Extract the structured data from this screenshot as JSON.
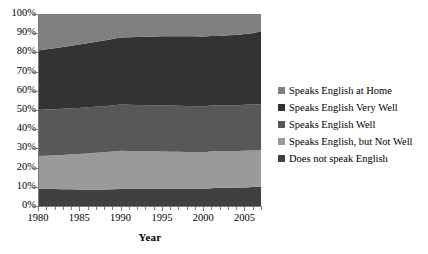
{
  "chart_data": {
    "type": "area",
    "stacked": true,
    "title": "",
    "xlabel": "Year",
    "ylabel": "",
    "xlim": [
      1980,
      2007
    ],
    "ylim": [
      0,
      100
    ],
    "grid": false,
    "legend_position": "right",
    "x": [
      1980,
      1981,
      1982,
      1983,
      1984,
      1985,
      1986,
      1987,
      1988,
      1989,
      1990,
      1991,
      1992,
      1993,
      1994,
      1995,
      1996,
      1997,
      1998,
      1999,
      2000,
      2001,
      2002,
      2003,
      2004,
      2005,
      2006,
      2007
    ],
    "x_tick_labels": [
      "1980",
      "1985",
      "1990",
      "1995",
      "2000",
      "2005"
    ],
    "x_tick_values": [
      1980,
      1985,
      1990,
      1995,
      2000,
      2005
    ],
    "y_tick_labels": [
      "0%",
      "10%",
      "20%",
      "30%",
      "40%",
      "50%",
      "60%",
      "70%",
      "80%",
      "90%",
      "100%"
    ],
    "y_tick_values": [
      0,
      10,
      20,
      30,
      40,
      50,
      60,
      70,
      80,
      90,
      100
    ],
    "series": [
      {
        "name": "Does not speak English",
        "color": "#404040",
        "values": [
          9.0,
          8.9,
          8.8,
          8.7,
          8.7,
          8.6,
          8.6,
          8.6,
          8.6,
          8.7,
          8.8,
          8.8,
          8.8,
          8.8,
          8.9,
          8.9,
          8.9,
          8.9,
          8.9,
          8.9,
          8.8,
          9.3,
          9.6,
          9.4,
          9.7,
          9.6,
          9.9,
          10.0
        ]
      },
      {
        "name": "Speaks English, but Not Well",
        "color": "#9a9a9a",
        "values": [
          17.0,
          17.3,
          17.6,
          17.9,
          18.2,
          18.5,
          18.8,
          19.1,
          19.4,
          19.7,
          20.0,
          19.9,
          19.8,
          19.7,
          19.6,
          19.5,
          19.4,
          19.3,
          19.2,
          19.1,
          19.0,
          19.2,
          19.1,
          19.2,
          19.0,
          19.2,
          19.0,
          19.0
        ]
      },
      {
        "name": "Speaks English Well",
        "color": "#585858",
        "values": [
          24.0,
          24.0,
          24.0,
          24.0,
          24.0,
          24.0,
          24.0,
          24.0,
          24.0,
          24.0,
          24.0,
          24.0,
          24.0,
          24.0,
          24.0,
          24.0,
          24.0,
          24.0,
          24.0,
          24.0,
          24.0,
          23.8,
          23.6,
          23.8,
          23.7,
          23.9,
          24.0,
          24.0
        ]
      },
      {
        "name": "Speaks English Very Well",
        "color": "#333333",
        "values": [
          31.0,
          31.4,
          31.8,
          32.2,
          32.6,
          33.0,
          33.4,
          33.8,
          34.2,
          34.6,
          35.0,
          35.2,
          35.4,
          35.6,
          35.8,
          36.0,
          36.1,
          36.2,
          36.3,
          36.4,
          36.5,
          36.2,
          36.3,
          36.5,
          36.6,
          36.9,
          37.1,
          38.0
        ]
      },
      {
        "name": "Speaks English at Home",
        "color": "#808080",
        "values": [
          19.0,
          18.4,
          17.8,
          17.2,
          16.5,
          15.9,
          15.2,
          14.5,
          13.8,
          13.0,
          12.2,
          12.3,
          12.0,
          11.9,
          11.7,
          11.6,
          11.6,
          11.6,
          11.6,
          11.6,
          11.7,
          11.5,
          11.4,
          11.1,
          11.0,
          10.4,
          10.0,
          9.0
        ]
      }
    ],
    "boundaries_note": {
      "1980": [
        9,
        26,
        50,
        81
      ],
      "2007": [
        10,
        29,
        53,
        91
      ]
    }
  },
  "legend": {
    "items": [
      {
        "label": "Speaks English at Home",
        "color": "#808080"
      },
      {
        "label": "Speaks English Very Well",
        "color": "#333333"
      },
      {
        "label": "Speaks English Well",
        "color": "#585858"
      },
      {
        "label": "Speaks English, but Not Well",
        "color": "#9a9a9a"
      },
      {
        "label": "Does not speak English",
        "color": "#404040"
      }
    ]
  },
  "axes": {
    "x_title": "Year"
  }
}
